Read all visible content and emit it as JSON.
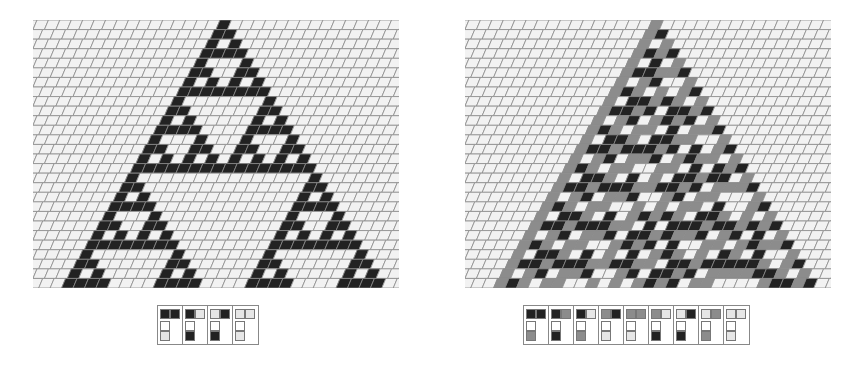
{
  "colors": {
    "background": "#ffffff",
    "grid_line": "#8a8a8a",
    "cell_empty": "#f2f2f2",
    "state_light": "#e6e6e6",
    "state_gray": "#8c8c8c",
    "state_black": "#222222"
  },
  "panels": [
    {
      "id": "left",
      "title": "2-color additive cellular automaton",
      "states": 2,
      "rows": 28,
      "cols": 32,
      "seed_col": 16,
      "seed_state": 1,
      "palette": [
        "#f2f2f2",
        "#222222"
      ],
      "rules": [
        {
          "left": 1,
          "right": 1,
          "result": 0
        },
        {
          "left": 1,
          "right": 0,
          "result": 1
        },
        {
          "left": 0,
          "right": 1,
          "result": 1
        },
        {
          "left": 0,
          "right": 0,
          "result": 0
        }
      ]
    },
    {
      "id": "right",
      "title": "3-color cellular automaton",
      "states": 3,
      "rows": 28,
      "cols": 32,
      "seed_col": 16,
      "seed_state": 1,
      "palette": [
        "#f2f2f2",
        "#8c8c8c",
        "#222222"
      ],
      "rules": [
        {
          "left": 2,
          "right": 2,
          "result": 1
        },
        {
          "left": 2,
          "right": 1,
          "result": 2
        },
        {
          "left": 2,
          "right": 0,
          "result": 1
        },
        {
          "left": 1,
          "right": 2,
          "result": 0
        },
        {
          "left": 1,
          "right": 1,
          "result": 0
        },
        {
          "left": 1,
          "right": 0,
          "result": 2
        },
        {
          "left": 0,
          "right": 2,
          "result": 2
        },
        {
          "left": 0,
          "right": 1,
          "result": 1
        },
        {
          "left": 0,
          "right": 0,
          "result": 0
        }
      ]
    }
  ]
}
